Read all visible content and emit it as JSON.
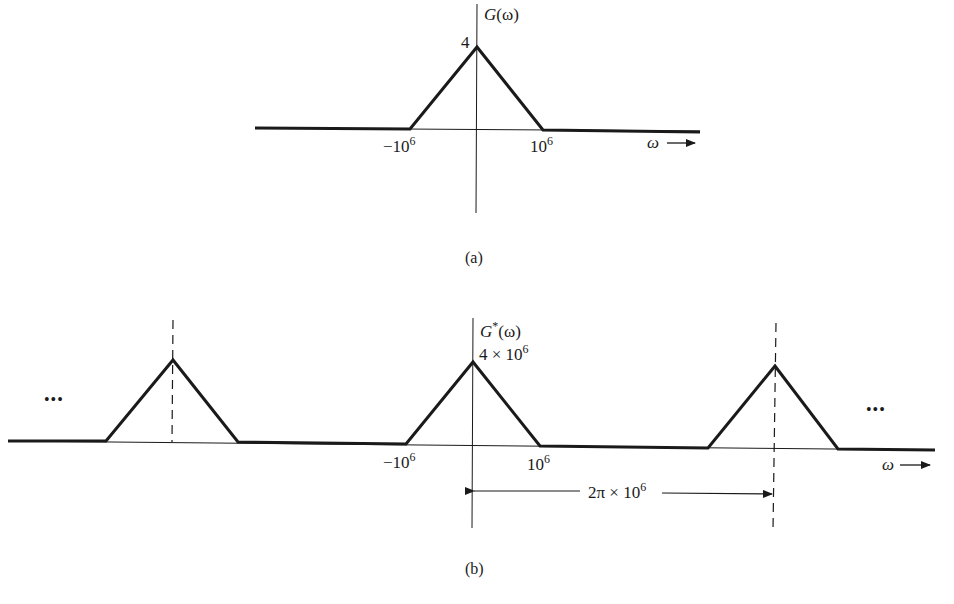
{
  "figure": {
    "panel_a": {
      "caption": "(a)",
      "y_label_fn": "G",
      "y_label_arg": "(ω)",
      "peak_label": "4",
      "x_tick_left_base": "−10",
      "x_tick_left_exp": "6",
      "x_tick_right_base": "10",
      "x_tick_right_exp": "6",
      "x_axis_label": "ω"
    },
    "panel_b": {
      "caption": "(b)",
      "y_label_fn": "G",
      "y_label_star": "*",
      "y_label_arg": "(ω)",
      "peak_label_base": "4 × 10",
      "peak_label_exp": "6",
      "x_tick_left_base": "−10",
      "x_tick_left_exp": "6",
      "x_tick_right_base": "10",
      "x_tick_right_exp": "6",
      "period_label_base": "2π × 10",
      "period_label_exp": "6",
      "x_axis_label": "ω",
      "ellipsis_left": "•••",
      "ellipsis_right": "•••"
    },
    "colors": {
      "ink": "#1a1a1a",
      "background": "#ffffff"
    }
  }
}
